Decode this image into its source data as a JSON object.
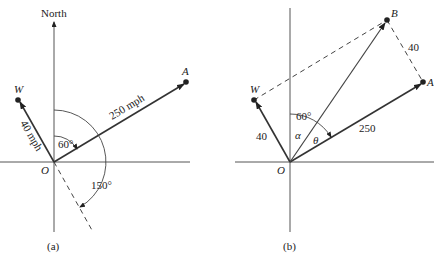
{
  "figure_a": {
    "caption": "(a)",
    "north_label": "North",
    "origin_label": "O",
    "point_w_label": "W",
    "point_a_label": "A",
    "wind_label": "40 mph",
    "plane_label": "250 mph",
    "angle_plane": "60°",
    "angle_wind": "150°"
  },
  "figure_b": {
    "caption": "(b)",
    "origin_label": "O",
    "point_w_label": "W",
    "point_a_label": "A",
    "point_b_label": "B",
    "wind_label": "40",
    "plane_label": "250",
    "side_ab_label": "40",
    "angle_60": "60°",
    "angle_alpha": "α",
    "angle_theta": "θ"
  }
}
